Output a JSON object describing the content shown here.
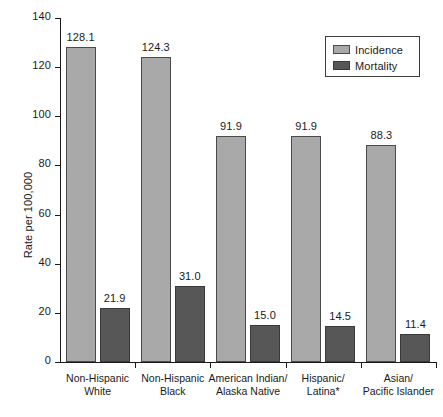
{
  "chart_data": {
    "type": "bar",
    "title": "",
    "xlabel": "",
    "ylabel": "Rate per 100,000",
    "ylim": [
      0,
      140
    ],
    "yticks": [
      0,
      20,
      40,
      60,
      80,
      100,
      120,
      140
    ],
    "ytick_labels": [
      "0",
      "20",
      "40",
      "60",
      "80",
      "100",
      "120",
      "140"
    ],
    "grid": false,
    "legend_position": "top-right",
    "categories": [
      "Non-Hispanic White",
      "Non-Hispanic Black",
      "American Indian/ Alaska Native",
      "Hispanic/ Latina*",
      "Asian/ Pacific Islander"
    ],
    "category_lines": [
      [
        "Non-Hispanic",
        "White"
      ],
      [
        "Non-Hispanic",
        "Black"
      ],
      [
        "American Indian/",
        "Alaska Native"
      ],
      [
        "Hispanic/",
        "Latina*"
      ],
      [
        "Asian/",
        "Pacific Islander"
      ]
    ],
    "series": [
      {
        "name": "Incidence",
        "color": "#a9a9a9",
        "values": [
          128.1,
          124.3,
          91.9,
          91.9,
          88.3
        ],
        "labels": [
          "128.1",
          "124.3",
          "91.9",
          "91.9",
          "88.3"
        ]
      },
      {
        "name": "Mortality",
        "color": "#575757",
        "values": [
          21.9,
          31.0,
          15.0,
          14.5,
          11.4
        ],
        "labels": [
          "21.9",
          "31.0",
          "15.0",
          "14.5",
          "11.4"
        ]
      }
    ]
  },
  "legend": {
    "entries": [
      {
        "label": "Incidence",
        "color": "#a9a9a9"
      },
      {
        "label": "Mortality",
        "color": "#575757"
      }
    ]
  }
}
